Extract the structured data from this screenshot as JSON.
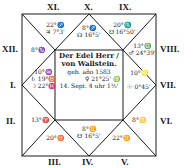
{
  "title": "Der Edel Herr / von Wallstein.",
  "center": {
    "line1": "Der Edel Herr /",
    "line2": "von Wallstein.",
    "line3": "geb. año 1583",
    "line4": "14. Sept. 4 uhr 1½'",
    "aside_right": "♀ 21°25' ♍"
  },
  "house_labels": {
    "I": "I.",
    "II": "II.",
    "III": "III.",
    "IV": "IV.",
    "V": "V.",
    "VI": "VI.",
    "VII": "VII.",
    "VIII": "VIII.",
    "IX": "IX.",
    "X": "X.",
    "XI": "XI.",
    "XII": "XII."
  },
  "houses": {
    "XI": {
      "line1": "22°♐",
      "line2": "♃ 7°3'"
    },
    "X": {
      "line1": "8°♐",
      "line2": "☊ 16°5'"
    },
    "IX": {
      "line1": "20°♏",
      "line2": "☋ 16°50'"
    },
    "VIII": {
      "line1": "13°♎",
      "line2": "♂ 24°39'"
    },
    "XII": {
      "line1": "8°♑"
    },
    "I": {
      "line1": "10°♒",
      "line2": "♄ 19°♉",
      "line3": "☽ 22°♓"
    },
    "VII": {
      "line1": "10°♌",
      "line2": "☉ 0°45'"
    },
    "II": {
      "line1": "13°♈"
    },
    "VI": {
      "line1": "8°♋"
    },
    "III": {
      "line1": "20°♉"
    },
    "IV": {
      "line1": "8°♊",
      "line2": "☋ 16°5'"
    },
    "V": {
      "line1": "22°♊"
    }
  },
  "colors": {
    "ink": "#1a1a1a",
    "paper": "#ffffff"
  }
}
